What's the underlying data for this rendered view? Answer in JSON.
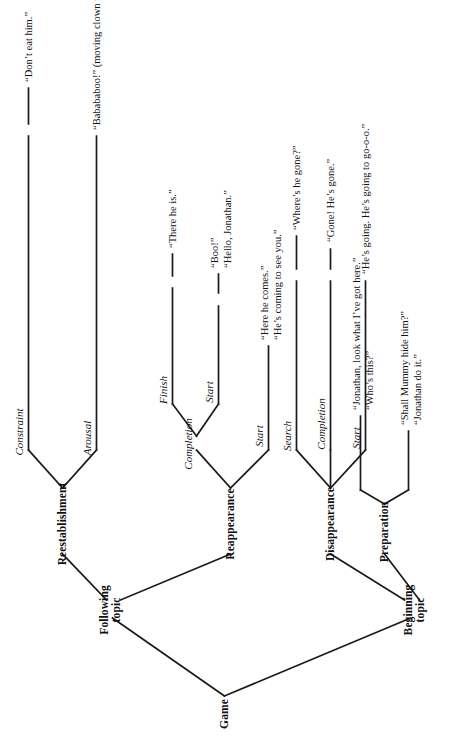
{
  "figure": {
    "type": "tree-diagram",
    "orientation": "rotated-90-counterclockwise",
    "root": "Game",
    "line_color": "#1a1a1a",
    "background_color": "#ffffff"
  },
  "nodes": {
    "root": "Game",
    "beginning_topic": "Beginning\ntopic",
    "beginning_topic_line1": "Beginning",
    "beginning_topic_line2": "topic",
    "following_topic_line1": "Following",
    "following_topic_line2": "topic",
    "preparation": "Preparation",
    "disappearance": "Disappearance",
    "reappearance": "Reappearance",
    "reestablishment": "Reestablishment"
  },
  "subcategories": {
    "disappearance_start": "Start",
    "disappearance_completion": "Completion",
    "disappearance_search": "Search",
    "reappearance_start": "Start",
    "reappearance_completion": "Completion",
    "reappearance_completion_start": "Start",
    "reappearance_completion_finish": "Finish",
    "reestablishment_arousal": "Arousal",
    "reestablishment_constraint": "Constraint"
  },
  "utterances": {
    "preparation_a_line1": "“Jonathan, look what I’ve got here.”",
    "preparation_a_line2": "“Who’s this?”",
    "preparation_b_line1": "“Shall Mummy hide him?”",
    "preparation_b_line2": "“Jonathan do it.”",
    "disappearance_start": "“He’s going. He’s going to go-o-o.”",
    "disappearance_completion": "“Gone! He’s gone.”",
    "disappearance_search": "“Where’s he gone?”",
    "reappearance_start_line1": "“Here he comes.”",
    "reappearance_start_line2": "“He’s coming to see you.”",
    "reappearance_completion_start_line1": "“Boo!”",
    "reappearance_completion_start_line2": "“Hello, Jonathan.”",
    "reappearance_completion_finish": "“There he is.”",
    "reestablishment_arousal": "“Babababoo!” (moving clown to his belly)",
    "reestablishment_constraint": "“Don’t eat him.”"
  }
}
